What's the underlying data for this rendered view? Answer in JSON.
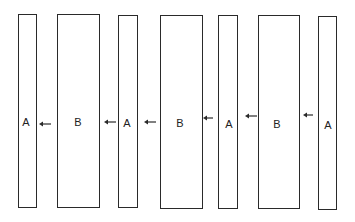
{
  "diagram": {
    "line_color": "#2a2a2a",
    "background_color": "#ffffff",
    "slabs": [
      {
        "label": "A",
        "type": "narrow"
      },
      {
        "label": "B",
        "type": "wide"
      },
      {
        "label": "A",
        "type": "narrow"
      },
      {
        "label": "B",
        "type": "wide"
      },
      {
        "label": "A",
        "type": "narrow"
      },
      {
        "label": "B",
        "type": "wide"
      },
      {
        "label": "A",
        "type": "narrow"
      }
    ],
    "arrows": [
      {
        "direction": "left",
        "from": "B",
        "to": "A"
      },
      {
        "direction": "left",
        "from": "A",
        "to": "B"
      },
      {
        "direction": "left",
        "from": "B",
        "to": "A"
      },
      {
        "direction": "left",
        "from": "A",
        "to": "B"
      },
      {
        "direction": "left",
        "from": "B",
        "to": "A"
      },
      {
        "direction": "left",
        "from": "A",
        "to": "B"
      }
    ]
  }
}
